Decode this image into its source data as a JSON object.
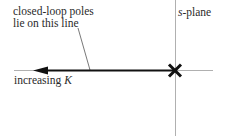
{
  "diagram": {
    "title": "s-plane",
    "annotation": {
      "line1": "closed-loop poles",
      "line2": "lie on this line"
    },
    "direction_label": {
      "text": "increasing ",
      "variable": "K"
    },
    "plane_label": {
      "variable": "s",
      "suffix": "-plane"
    },
    "elements": {
      "pole_marker": "×",
      "arrow_direction": "left"
    },
    "colors": {
      "axis": "#b0b0b0",
      "locus": "#111111",
      "text": "#2a2a2a",
      "leader": "#555555"
    }
  }
}
